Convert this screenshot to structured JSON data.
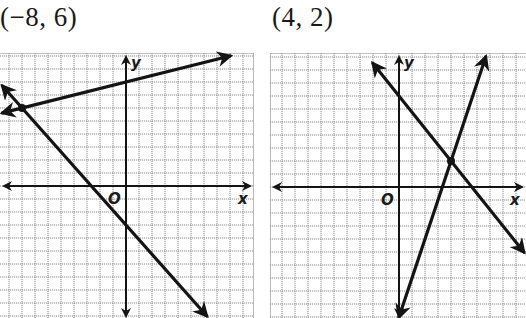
{
  "titles": {
    "left": "(−8, 6)",
    "right": "(4, 2)"
  },
  "labels": {
    "x": "x",
    "y": "y",
    "origin": "O"
  },
  "colors": {
    "line": "#141414",
    "grid": "#8a8a8a",
    "background": "#ffffff"
  },
  "chart_data": [
    {
      "type": "line",
      "title": "(−8, 6)",
      "xlabel": "x",
      "ylabel": "y",
      "grid": true,
      "xlim": [
        -10,
        10
      ],
      "ylim": [
        -10,
        10
      ],
      "series": [
        {
          "name": "line 1",
          "equation": "y = 1/4 x + 8",
          "x": [
            -9.5,
            8
          ],
          "y": [
            5.625,
            10
          ]
        },
        {
          "name": "line 2",
          "equation": "y = -9/8 x - 3",
          "x": [
            -9.5,
            6.2
          ],
          "y": [
            7.69,
            -9.98
          ]
        }
      ],
      "intersection": [
        -8,
        6
      ],
      "view": {
        "origin_px": [
          126,
          186
        ],
        "cell_px": 13,
        "grid_px": [
          0,
          53,
          254,
          318
        ]
      }
    },
    {
      "type": "line",
      "title": "(4, 2)",
      "xlabel": "x",
      "ylabel": "y",
      "grid": true,
      "xlim": [
        -10,
        10
      ],
      "ylim": [
        -10,
        10
      ],
      "series": [
        {
          "name": "line 1",
          "equation": "y = 3x - 10",
          "x": [
            0,
            6.67
          ],
          "y": [
            -10,
            10
          ]
        },
        {
          "name": "line 2",
          "equation": "y = -5/4 x + 7",
          "x": [
            -2,
            9.6
          ],
          "y": [
            9.5,
            -5
          ]
        }
      ],
      "intersection": [
        4,
        2
      ],
      "view": {
        "origin_px": [
          399,
          187
        ],
        "cell_px": 13,
        "grid_px": [
          270,
          53,
          526,
          318
        ]
      }
    }
  ]
}
